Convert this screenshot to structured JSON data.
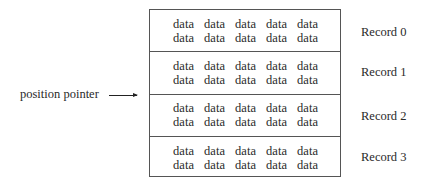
{
  "diagram": {
    "pointer_label": "position pointer",
    "records": [
      {
        "label": "Record 0",
        "lines": [
          [
            "data",
            "data",
            "data",
            "data",
            "data"
          ],
          [
            "data",
            "data",
            "data",
            "data",
            "data"
          ]
        ]
      },
      {
        "label": "Record 1",
        "lines": [
          [
            "data",
            "data",
            "data",
            "data",
            "data"
          ],
          [
            "data",
            "data",
            "data",
            "data",
            "data"
          ]
        ]
      },
      {
        "label": "Record 2",
        "lines": [
          [
            "data",
            "data",
            "data",
            "data",
            "data"
          ],
          [
            "data",
            "data",
            "data",
            "data",
            "data"
          ]
        ]
      },
      {
        "label": "Record 3",
        "lines": [
          [
            "data",
            "data",
            "data",
            "data",
            "data"
          ],
          [
            "data",
            "data",
            "data",
            "data",
            "data"
          ]
        ]
      }
    ],
    "pointer_target": "boundary between Record 1 and Record 2"
  }
}
